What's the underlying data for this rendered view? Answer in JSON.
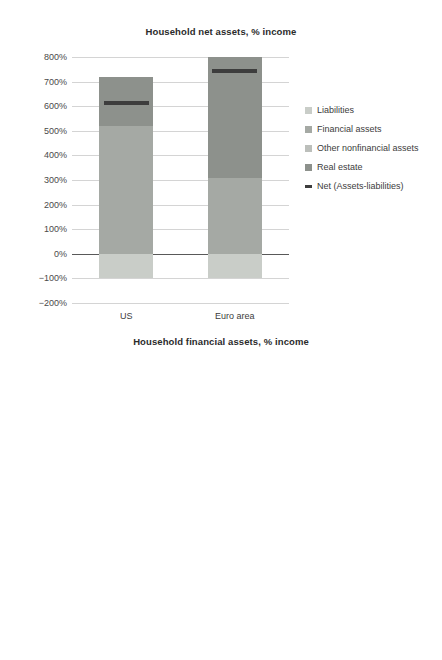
{
  "chart_data": [
    {
      "type": "bar",
      "title": "Household net assets, % income",
      "xlabel": "",
      "ylabel": "",
      "categories": [
        "US",
        "Euro area"
      ],
      "ylim": [
        -200,
        800
      ],
      "yticks": [
        "-200%",
        "-100%",
        "0%",
        "100%",
        "200%",
        "300%",
        "400%",
        "500%",
        "600%",
        "700%",
        "800%"
      ],
      "grid": true,
      "legend_position": "right",
      "stacked": true,
      "series": [
        {
          "name": "Liabilities",
          "color": "#c9cdc8",
          "values": [
            -100,
            -100
          ]
        },
        {
          "name": "Financial assets",
          "color": "#a5a9a4",
          "values": [
            520,
            310
          ]
        },
        {
          "name": "Other nonfinancial assets",
          "color": "#bcbfbb",
          "values": [
            0,
            0
          ]
        },
        {
          "name": "Real estate",
          "color": "#8d918c",
          "values": [
            200,
            490
          ]
        }
      ],
      "markers": [
        {
          "name": "Net (Assets-liabilities)",
          "color": "#3d3d3d",
          "values": [
            615,
            745
          ]
        }
      ],
      "totals": [
        720,
        800
      ]
    },
    {
      "type": "bar",
      "title": "Household financial assets, % income",
      "xlabel": "",
      "ylabel": "",
      "categories": [
        "US",
        "Euro area"
      ],
      "ylim": [
        -200,
        800
      ],
      "yticks": [
        "-200%",
        "-100%",
        "0%",
        "100%",
        "200%",
        "300%",
        "400%",
        "500%",
        "600%",
        "700%",
        "800%"
      ],
      "grid": true,
      "legend_position": "right",
      "stacked": true,
      "series": [
        {
          "name": "Currency and deposits",
          "color": "#9a9e99",
          "values": [
            110,
            130
          ]
        },
        {
          "name": "Debt securities and loans",
          "color": "#b0b4af",
          "values": [
            5,
            8
          ]
        },
        {
          "name": "Listed shares",
          "color": "#8e928d",
          "values": [
            95,
            15
          ]
        },
        {
          "name": "Unlisted shares and other equity",
          "color": "#d2d5d1",
          "values": [
            85,
            40
          ]
        },
        {
          "name": "Investment fund shares (incl MMF)",
          "color": "#73776f",
          "values": [
            50,
            27
          ]
        },
        {
          "name": "Insurance and pension schemes",
          "color": "#8d918c",
          "values": [
            165,
            125
          ]
        },
        {
          "name": "Other",
          "color": "#5e625c",
          "values": [
            10,
            0
          ]
        }
      ],
      "totals": [
        520,
        345
      ]
    }
  ],
  "charts": [
    {
      "id": "chart-top",
      "title": "Household net assets, % income",
      "yticks": [
        "800%",
        "700%",
        "600%",
        "500%",
        "400%",
        "300%",
        "200%",
        "100%",
        "0%",
        "-100%",
        "-200%"
      ],
      "xlabels": [
        "US",
        "Euro area"
      ],
      "legend": [
        {
          "label": "Liabilities",
          "type": "box"
        },
        {
          "label": "Financial assets",
          "type": "box"
        },
        {
          "label": "Other nonfinancial assets",
          "type": "box"
        },
        {
          "label": "Real estate",
          "type": "box"
        },
        {
          "label": "Net (Assets-liabilities)",
          "type": "line"
        }
      ]
    },
    {
      "id": "chart-bottom",
      "title": "Household financial assets, % income",
      "yticks": [
        "800%",
        "700%",
        "600%",
        "500%",
        "400%",
        "300%",
        "200%",
        "100%",
        "0%",
        "-100%",
        "-200%"
      ],
      "xlabels": [
        "US",
        "Euro area"
      ],
      "legend": [
        {
          "label": "Other",
          "type": "box"
        },
        {
          "label": "Insurance and pension schemes",
          "type": "box"
        },
        {
          "label": "Investment fund shares (incl MMF)",
          "type": "box"
        },
        {
          "label": "Unlisted shares and other equity",
          "type": "box"
        },
        {
          "label": "Listed shares",
          "type": "box"
        },
        {
          "label": "Debt securities and loans",
          "type": "box"
        },
        {
          "label": "Currency and deposits",
          "type": "box"
        }
      ]
    }
  ],
  "colors": {
    "gridline": "#d4d4d4",
    "axis": "#595959",
    "text": "#3c3c3c",
    "background": "#ffffff"
  }
}
